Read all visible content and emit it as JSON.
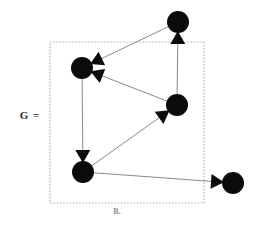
{
  "figure": {
    "lhs_label": "G =",
    "caption": "B.",
    "background_color": "#ffffff"
  },
  "frame": {
    "name": "dotted-bounding-box",
    "x": 50,
    "y": 42,
    "width": 154,
    "height": 161,
    "stroke_color": "#b4b4b4",
    "style": "dotted"
  },
  "chart_data": {
    "type": "diagram",
    "diagram_kind": "directed-graph",
    "title": "G =",
    "caption": "B.",
    "node_color": "#0b0b0b",
    "edge_color": "#8a8a8a",
    "arrow_color": "#0b0b0b",
    "node_radius": 11,
    "nodes": [
      {
        "id": "n1",
        "name": "node-top",
        "x": 178,
        "y": 22,
        "r": 11
      },
      {
        "id": "n2",
        "name": "node-upper-left",
        "x": 82,
        "y": 68,
        "r": 11
      },
      {
        "id": "n3",
        "name": "node-middle-right",
        "x": 177,
        "y": 105,
        "r": 11
      },
      {
        "id": "n4",
        "name": "node-lower-left",
        "x": 83,
        "y": 172,
        "r": 11
      },
      {
        "id": "n5",
        "name": "node-bottom-right",
        "x": 233,
        "y": 183,
        "r": 11
      }
    ],
    "edges": [
      {
        "id": "e1",
        "name": "edge-top-to-upper-left",
        "from": "n1",
        "to": "n2",
        "directed": true
      },
      {
        "id": "e2",
        "name": "edge-middle-right-to-upper-left",
        "from": "n3",
        "to": "n2",
        "directed": true
      },
      {
        "id": "e3",
        "name": "edge-middle-right-to-top",
        "from": "n3",
        "to": "n1",
        "directed": true
      },
      {
        "id": "e4",
        "name": "edge-upper-left-to-lower-left",
        "from": "n2",
        "to": "n4",
        "directed": true
      },
      {
        "id": "e5",
        "name": "edge-lower-left-to-middle-right",
        "from": "n4",
        "to": "n3",
        "directed": true
      },
      {
        "id": "e6",
        "name": "edge-lower-left-to-bottom-right",
        "from": "n4",
        "to": "n5",
        "directed": true
      }
    ],
    "node_count": 5,
    "edge_count": 6
  }
}
